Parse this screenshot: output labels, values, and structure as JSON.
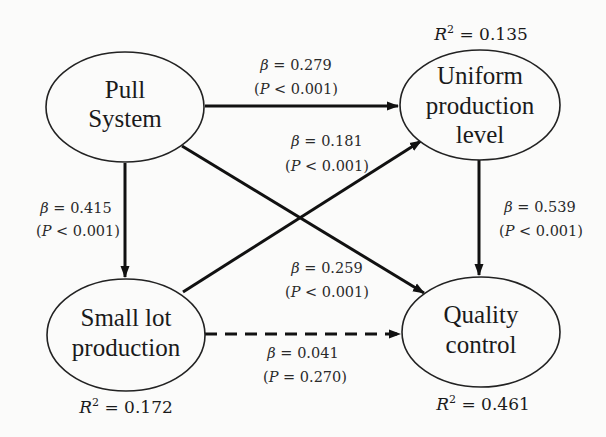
{
  "nodes": {
    "pull_system": {
      "lines": [
        "Pull",
        "System"
      ]
    },
    "uniform": {
      "lines": [
        "Uniform",
        "production",
        "level"
      ],
      "r2": "0.135"
    },
    "small_lot": {
      "lines": [
        "Small lot",
        "production"
      ],
      "r2": "0.172"
    },
    "quality": {
      "lines": [
        "Quality",
        "control"
      ],
      "r2": "0.461"
    }
  },
  "paths": {
    "pull_to_uniform": {
      "beta": "0.279",
      "p_op": "<",
      "p": "0.001",
      "style": "solid"
    },
    "smalllot_to_uniform": {
      "beta": "0.181",
      "p_op": "<",
      "p": "0.001",
      "style": "solid"
    },
    "pull_to_smalllot": {
      "beta": "0.415",
      "p_op": "<",
      "p": "0.001",
      "style": "solid"
    },
    "uniform_to_quality": {
      "beta": "0.539",
      "p_op": "<",
      "p": "0.001",
      "style": "solid"
    },
    "pull_to_quality": {
      "beta": "0.259",
      "p_op": "<",
      "p": "0.001",
      "style": "solid"
    },
    "smalllot_to_quality": {
      "beta": "0.041",
      "p_op": "=",
      "p": "0.270",
      "style": "dashed"
    }
  },
  "symbols": {
    "beta": "β",
    "p": "P",
    "r2": "R",
    "eq": " = "
  }
}
